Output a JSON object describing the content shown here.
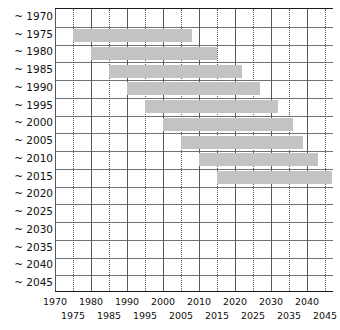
{
  "chart_data": {
    "type": "bar",
    "orientation": "horizontal-gantt",
    "title": "",
    "subtitle": "",
    "xlabel": "",
    "ylabel": "",
    "xlim": [
      1970,
      2047
    ],
    "grid": true,
    "legend": null,
    "bar_color": "#c3c3c3",
    "axis_color": "#1a1a1a",
    "gridline_color": "#55585c",
    "categories": [
      "~ 1970",
      "~ 1975",
      "~ 1980",
      "~ 1985",
      "~ 1990",
      "~ 1995",
      "~ 2000",
      "~ 2005",
      "~ 2010",
      "~ 2015",
      "~ 2020",
      "~ 2025",
      "~ 2030",
      "~ 2035",
      "~ 2040",
      "~ 2045"
    ],
    "bars": [
      {
        "category": "~ 1970",
        "start": null,
        "end": null
      },
      {
        "category": "~ 1975",
        "start": 1975,
        "end": 2008
      },
      {
        "category": "~ 1980",
        "start": 1980,
        "end": 2015
      },
      {
        "category": "~ 1985",
        "start": 1985,
        "end": 2022
      },
      {
        "category": "~ 1990",
        "start": 1990,
        "end": 2027
      },
      {
        "category": "~ 1995",
        "start": 1995,
        "end": 2032
      },
      {
        "category": "~ 2000",
        "start": 2000,
        "end": 2036
      },
      {
        "category": "~ 2005",
        "start": 2005,
        "end": 2039
      },
      {
        "category": "~ 2010",
        "start": 2010,
        "end": 2043
      },
      {
        "category": "~ 2015",
        "start": 2015,
        "end": 2047
      },
      {
        "category": "~ 2020",
        "start": null,
        "end": null
      },
      {
        "category": "~ 2025",
        "start": null,
        "end": null
      },
      {
        "category": "~ 2030",
        "start": null,
        "end": null
      },
      {
        "category": "~ 2035",
        "start": null,
        "end": null
      },
      {
        "category": "~ 2040",
        "start": null,
        "end": null
      },
      {
        "category": "~ 2045",
        "start": null,
        "end": null
      }
    ],
    "x_ticks_major": [
      1970,
      1980,
      1990,
      2000,
      2010,
      2020,
      2030,
      2040
    ],
    "x_ticks_minor": [
      1975,
      1985,
      1995,
      2005,
      2015,
      2025,
      2035,
      2045
    ],
    "x_tick_labels_top": [
      "1970",
      "1980",
      "1990",
      "2000",
      "2010",
      "2020",
      "2030",
      "2040"
    ],
    "x_tick_labels_bottom": [
      "1975",
      "1985",
      "1995",
      "2005",
      "2015",
      "2025",
      "2035",
      "2045"
    ]
  },
  "axis": {
    "y_labels": [
      "~ 1970",
      "~ 1975",
      "~ 1980",
      "~ 1985",
      "~ 1990",
      "~ 1995",
      "~ 2000",
      "~ 2005",
      "~ 2010",
      "~ 2015",
      "~ 2020",
      "~ 2025",
      "~ 2030",
      "~ 2035",
      "~ 2040",
      "~ 2045"
    ]
  }
}
